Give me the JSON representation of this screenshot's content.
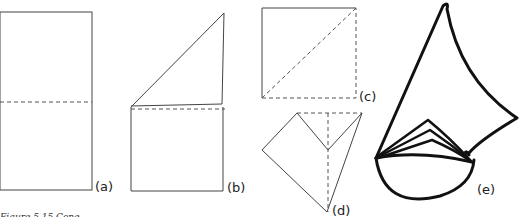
{
  "figure": {
    "caption": "Figure 5.15  Cone",
    "panels": [
      {
        "id": "a",
        "label": "(a)",
        "description": "rectangle folded in half with dashed horizontal center fold"
      },
      {
        "id": "b",
        "label": "(b)",
        "description": "top half folded diagonally forming a triangle above dashed fold"
      },
      {
        "id": "c",
        "label": "(c)",
        "description": "square with dashed diagonal fold line"
      },
      {
        "id": "d",
        "label": "(d)",
        "description": "folded kite shape with dashed fold lines"
      },
      {
        "id": "e",
        "label": "(e)",
        "description": "finished cone with layered folded base"
      }
    ]
  }
}
